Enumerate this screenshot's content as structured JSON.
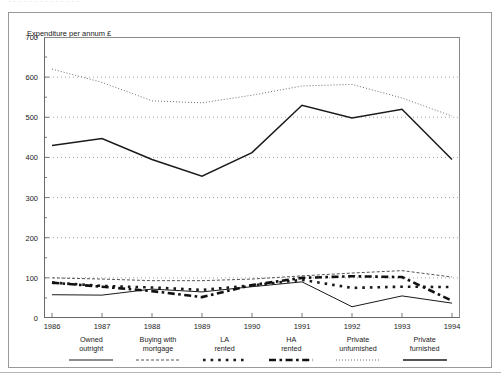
{
  "header": {
    "cut_title": "· · · ·    · · ·     · ·      · · ·      · ·",
    "axis_title": "Expenditure per annum £"
  },
  "chart_data": {
    "type": "line",
    "title": "Expenditure per annum £",
    "xlabel": "",
    "ylabel": "Expenditure per annum £",
    "x": [
      1986,
      1987,
      1988,
      1989,
      1990,
      1991,
      1992,
      1993,
      1994
    ],
    "categories": [
      "1986",
      "1987",
      "1988",
      "1989",
      "1990",
      "1991",
      "1992",
      "1993",
      "1994"
    ],
    "ylim": [
      0,
      700
    ],
    "yticks": [
      0,
      100,
      200,
      300,
      400,
      500,
      600,
      700
    ],
    "ytick_labels": [
      "0",
      "100",
      "200",
      "300",
      "400",
      "500",
      "600",
      "700"
    ],
    "grid": "horizontal-dotted",
    "legend_position": "bottom",
    "series": [
      {
        "name": "Owned outright",
        "label_line1": "Owned",
        "label_line2": "outright",
        "style": "solid-thin",
        "color": "#1a1a1a",
        "values": [
          58,
          57,
          72,
          65,
          78,
          90,
          28,
          55,
          37
        ]
      },
      {
        "name": "Buying with mortgage",
        "label_line1": "Buying with",
        "label_line2": "mortgage",
        "style": "fine-dashed",
        "color": "#555555",
        "values": [
          100,
          97,
          93,
          93,
          97,
          105,
          112,
          118,
          102
        ]
      },
      {
        "name": "LA rented",
        "label_line1": "LA",
        "label_line2": "rented",
        "style": "square-dotted",
        "color": "#1a1a1a",
        "values": [
          88,
          80,
          76,
          70,
          81,
          95,
          75,
          78,
          77
        ]
      },
      {
        "name": "HA rented",
        "label_line1": "HA",
        "label_line2": "rented",
        "style": "thick-dashdot",
        "color": "#111111",
        "values": [
          88,
          78,
          67,
          52,
          82,
          100,
          104,
          102,
          43
        ]
      },
      {
        "name": "Private unfurnished",
        "label_line1": "Private",
        "label_line2": "unfurnished",
        "style": "fine-dotted",
        "color": "#6e6e6e",
        "values": [
          620,
          587,
          541,
          536,
          555,
          578,
          582,
          548,
          503
        ]
      },
      {
        "name": "Private furnished",
        "label_line1": "Private",
        "label_line2": "furnished",
        "style": "solid-medium",
        "color": "#1a1a1a",
        "values": [
          430,
          447,
          395,
          353,
          412,
          530,
          498,
          520,
          395
        ]
      }
    ]
  }
}
